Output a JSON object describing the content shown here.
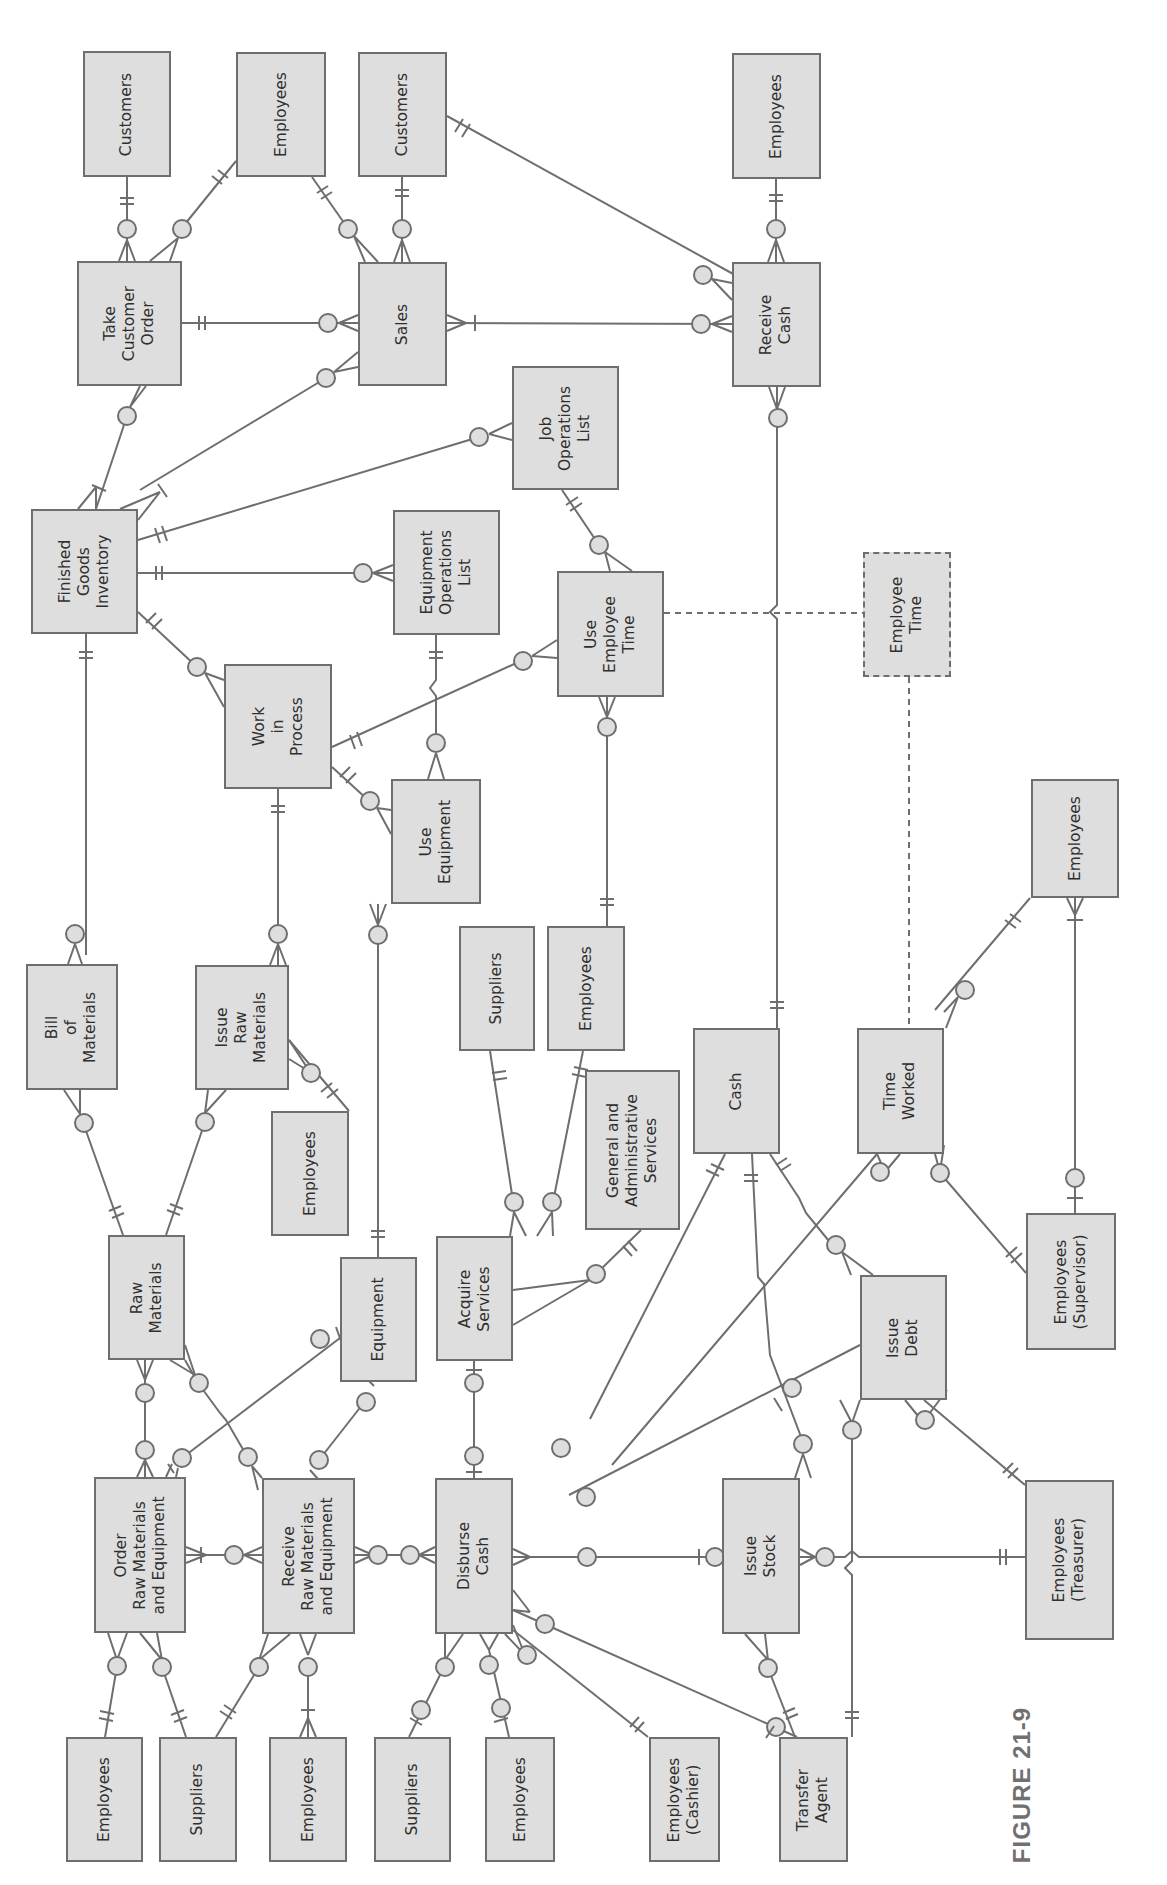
{
  "figure": {
    "label": "FIGURE 21-9"
  },
  "colors": {
    "entity_fill": "#dedede",
    "entity_border": "#6e6e6e",
    "line": "#6e6e6e",
    "text": "#2f2f2f",
    "figure_label": "#707070"
  },
  "orientation": "rotated 90 degrees counter-clockwise (text reads bottom-to-top)",
  "entities": [
    {
      "id": "customers_1",
      "label": "Customers",
      "x": 83,
      "y": 51,
      "w": 88,
      "h": 126
    },
    {
      "id": "employees_1",
      "label": "Employees",
      "x": 236,
      "y": 52,
      "w": 90,
      "h": 125
    },
    {
      "id": "customers_2",
      "label": "Customers",
      "x": 358,
      "y": 52,
      "w": 89,
      "h": 125
    },
    {
      "id": "employees_2",
      "label": "Employees",
      "x": 732,
      "y": 53,
      "w": 89,
      "h": 126
    },
    {
      "id": "take_customer_order",
      "label": "Take\nCustomer\nOrder",
      "x": 77,
      "y": 261,
      "w": 105,
      "h": 125
    },
    {
      "id": "sales",
      "label": "Sales",
      "x": 358,
      "y": 262,
      "w": 89,
      "h": 124
    },
    {
      "id": "receive_cash",
      "label": "Receive\nCash",
      "x": 732,
      "y": 262,
      "w": 89,
      "h": 125
    },
    {
      "id": "job_operations_list",
      "label": "Job\nOperations\nList",
      "x": 512,
      "y": 366,
      "w": 107,
      "h": 124
    },
    {
      "id": "finished_goods_inventory",
      "label": "Finished\nGoods\nInventory",
      "x": 31,
      "y": 509,
      "w": 107,
      "h": 125
    },
    {
      "id": "equipment_operations_list",
      "label": "Equipment\nOperations\nList",
      "x": 393,
      "y": 510,
      "w": 107,
      "h": 125
    },
    {
      "id": "use_employee_time",
      "label": "Use\nEmployee\nTime",
      "x": 557,
      "y": 571,
      "w": 107,
      "h": 126
    },
    {
      "id": "employee_time",
      "label": "Employee\nTime",
      "x": 863,
      "y": 552,
      "w": 88,
      "h": 125,
      "dashed": true
    },
    {
      "id": "work_in_process",
      "label": "Work\nin\nProcess",
      "x": 224,
      "y": 664,
      "w": 108,
      "h": 125
    },
    {
      "id": "use_equipment",
      "label": "Use\nEquipment",
      "x": 391,
      "y": 779,
      "w": 90,
      "h": 125
    },
    {
      "id": "employees_3",
      "label": "Employees",
      "x": 1031,
      "y": 779,
      "w": 88,
      "h": 119
    },
    {
      "id": "bill_of_materials",
      "label": "Bill\nof\nMaterials",
      "x": 26,
      "y": 964,
      "w": 92,
      "h": 126
    },
    {
      "id": "issue_raw_materials",
      "label": "Issue\nRaw\nMaterials",
      "x": 195,
      "y": 965,
      "w": 94,
      "h": 125
    },
    {
      "id": "suppliers_1",
      "label": "Suppliers",
      "x": 459,
      "y": 926,
      "w": 76,
      "h": 125
    },
    {
      "id": "employees_4",
      "label": "Employees",
      "x": 547,
      "y": 926,
      "w": 78,
      "h": 125
    },
    {
      "id": "gen_admin_services",
      "label": "General and\nAdministrative\nServices",
      "x": 585,
      "y": 1070,
      "w": 95,
      "h": 160
    },
    {
      "id": "cash",
      "label": "Cash",
      "x": 693,
      "y": 1028,
      "w": 87,
      "h": 126
    },
    {
      "id": "time_worked",
      "label": "Time\nWorked",
      "x": 857,
      "y": 1028,
      "w": 87,
      "h": 126
    },
    {
      "id": "employees_5",
      "label": "Employees",
      "x": 271,
      "y": 1111,
      "w": 78,
      "h": 125
    },
    {
      "id": "raw_materials",
      "label": "Raw\nMaterials",
      "x": 108,
      "y": 1235,
      "w": 77,
      "h": 125
    },
    {
      "id": "equipment",
      "label": "Equipment",
      "x": 340,
      "y": 1257,
      "w": 77,
      "h": 125
    },
    {
      "id": "acquire_services",
      "label": "Acquire\nServices",
      "x": 436,
      "y": 1236,
      "w": 77,
      "h": 125
    },
    {
      "id": "issue_debt",
      "label": "Issue\nDebt",
      "x": 860,
      "y": 1275,
      "w": 87,
      "h": 125
    },
    {
      "id": "employees_supervisor",
      "label": "Employees\n(Supervisor)",
      "x": 1026,
      "y": 1213,
      "w": 90,
      "h": 137
    },
    {
      "id": "order_rm_equipment",
      "label": "Order\nRaw Materials\nand Equipment",
      "x": 94,
      "y": 1477,
      "w": 92,
      "h": 156
    },
    {
      "id": "receive_rm_equipment",
      "label": "Receive\nRaw Materials\nand Equipment",
      "x": 262,
      "y": 1478,
      "w": 93,
      "h": 156
    },
    {
      "id": "disburse_cash",
      "label": "Disburse\nCash",
      "x": 435,
      "y": 1478,
      "w": 78,
      "h": 156
    },
    {
      "id": "issue_stock",
      "label": "Issue\nStock",
      "x": 722,
      "y": 1478,
      "w": 78,
      "h": 156
    },
    {
      "id": "employees_treasurer",
      "label": "Employees\n(Treasurer)",
      "x": 1025,
      "y": 1480,
      "w": 89,
      "h": 160
    },
    {
      "id": "employees_6",
      "label": "Employees",
      "x": 66,
      "y": 1737,
      "w": 77,
      "h": 125
    },
    {
      "id": "suppliers_2",
      "label": "Suppliers",
      "x": 159,
      "y": 1737,
      "w": 78,
      "h": 125
    },
    {
      "id": "employees_7",
      "label": "Employees",
      "x": 269,
      "y": 1737,
      "w": 78,
      "h": 125
    },
    {
      "id": "suppliers_3",
      "label": "Suppliers",
      "x": 374,
      "y": 1737,
      "w": 77,
      "h": 125
    },
    {
      "id": "employees_8",
      "label": "Employees",
      "x": 545,
      "y": 1737,
      "w": 70,
      "h": 125
    },
    {
      "id": "employees_cashier",
      "label": "Employees\n(Cashier)",
      "x": 649,
      "y": 1737,
      "w": 71,
      "h": 125
    },
    {
      "id": "transfer_agent",
      "label": "Transfer\nAgent",
      "x": 779,
      "y": 1737,
      "w": 69,
      "h": 125
    }
  ],
  "relationships": [
    {
      "from": "customers_1",
      "to": "take_customer_order",
      "from_card": "one-and-only-one",
      "to_card": "zero-or-many"
    },
    {
      "from": "employees_1",
      "to": "take_customer_order",
      "from_card": "one-and-only-one",
      "to_card": "zero-or-many"
    },
    {
      "from": "employees_1",
      "to": "sales",
      "from_card": "one-and-only-one",
      "to_card": "zero-or-many"
    },
    {
      "from": "customers_2",
      "to": "sales",
      "from_card": "one-and-only-one",
      "to_card": "zero-or-many"
    },
    {
      "from": "customers_2",
      "to": "receive_cash",
      "from_card": "one-and-only-one",
      "to_card": "zero-or-many"
    },
    {
      "from": "employees_2",
      "to": "receive_cash",
      "from_card": "one-and-only-one",
      "to_card": "zero-or-many"
    },
    {
      "from": "take_customer_order",
      "to": "sales",
      "from_card": "one-and-only-one",
      "to_card": "zero-or-many"
    },
    {
      "from": "sales",
      "to": "receive_cash",
      "from_card": "one-or-many",
      "to_card": "zero-or-many"
    },
    {
      "from": "finished_goods_inventory",
      "to": "take_customer_order",
      "from_card": "one-or-many",
      "to_card": "zero-or-many"
    },
    {
      "from": "finished_goods_inventory",
      "to": "sales",
      "from_card": "one-or-many",
      "to_card": "zero-or-many"
    },
    {
      "from": "finished_goods_inventory",
      "to": "job_operations_list",
      "from_card": "one-and-only-one",
      "to_card": "zero-or-many"
    },
    {
      "from": "finished_goods_inventory",
      "to": "equipment_operations_list",
      "from_card": "one-and-only-one",
      "to_card": "zero-or-many"
    },
    {
      "from": "finished_goods_inventory",
      "to": "work_in_process",
      "from_card": "one-and-only-one",
      "to_card": "zero-or-many"
    },
    {
      "from": "finished_goods_inventory",
      "to": "bill_of_materials",
      "from_card": "one-and-only-one",
      "to_card": "zero-or-many"
    },
    {
      "from": "job_operations_list",
      "to": "use_employee_time",
      "from_card": "one-and-only-one",
      "to_card": "zero-or-many"
    },
    {
      "from": "equipment_operations_list",
      "to": "use_equipment",
      "from_card": "one-and-only-one",
      "to_card": "zero-or-many"
    },
    {
      "from": "work_in_process",
      "to": "use_employee_time",
      "from_card": "one-and-only-one",
      "to_card": "zero-or-many"
    },
    {
      "from": "work_in_process",
      "to": "use_equipment",
      "from_card": "one-and-only-one",
      "to_card": "zero-or-many"
    },
    {
      "from": "work_in_process",
      "to": "issue_raw_materials",
      "from_card": "one-and-only-one",
      "to_card": "zero-or-many"
    },
    {
      "from": "use_employee_time",
      "to": "employees_4",
      "from_card": "zero-or-many",
      "to_card": "one-and-only-one"
    },
    {
      "from": "use_employee_time",
      "to": "employee_time",
      "style": "dashed"
    },
    {
      "from": "employee_time",
      "to": "time_worked",
      "style": "dashed"
    },
    {
      "from": "use_equipment",
      "to": "equipment",
      "from_card": "zero-or-many",
      "to_card": "one-and-only-one"
    },
    {
      "from": "receive_cash",
      "to": "cash",
      "from_card": "zero-or-many",
      "to_card": "one-and-only-one"
    },
    {
      "from": "bill_of_materials",
      "to": "raw_materials",
      "from_card": "zero-or-many",
      "to_card": "one-and-only-one"
    },
    {
      "from": "issue_raw_materials",
      "to": "raw_materials",
      "from_card": "zero-or-many",
      "to_card": "one-and-only-one"
    },
    {
      "from": "issue_raw_materials",
      "to": "employees_5",
      "from_card": "zero-or-many",
      "to_card": "one-or-many"
    },
    {
      "from": "suppliers_1",
      "to": "acquire_services",
      "from_card": "one-and-only-one",
      "to_card": "zero-or-many"
    },
    {
      "from": "employees_4",
      "to": "acquire_services",
      "from_card": "one-and-only-one",
      "to_card": "zero-or-many"
    },
    {
      "from": "gen_admin_services",
      "to": "acquire_services",
      "from_card": "one-and-only-one",
      "to_card": "zero-or-many"
    },
    {
      "from": "cash",
      "to": "disburse_cash",
      "from_card": "one-and-only-one",
      "to_card": "zero-or-many"
    },
    {
      "from": "cash",
      "to": "issue_stock",
      "from_card": "one-and-only-one",
      "to_card": "zero-or-many"
    },
    {
      "from": "cash",
      "to": "issue_debt",
      "from_card": "one-and-only-one",
      "to_card": "zero-or-many"
    },
    {
      "from": "time_worked",
      "to": "employees_3",
      "from_card": "zero-or-many",
      "to_card": "one-and-only-one"
    },
    {
      "from": "time_worked",
      "to": "employees_supervisor",
      "from_card": "zero-or-many",
      "to_card": "one-and-only-one"
    },
    {
      "from": "time_worked",
      "to": "disburse_cash",
      "from_card": "zero-or-many",
      "to_card": "one-and-only-one"
    },
    {
      "from": "employees_3",
      "to": "employees_supervisor",
      "from_card": "one-or-many",
      "to_card": "zero-or-one"
    },
    {
      "from": "raw_materials",
      "to": "order_rm_equipment",
      "from_card": "one-or-many",
      "to_card": "zero-or-many"
    },
    {
      "from": "raw_materials",
      "to": "receive_rm_equipment",
      "from_card": "one-or-many",
      "to_card": "zero-or-many"
    },
    {
      "from": "equipment",
      "to": "order_rm_equipment",
      "from_card": "one-or-many",
      "to_card": "zero-or-many"
    },
    {
      "from": "equipment",
      "to": "receive_rm_equipment",
      "from_card": "one-or-many",
      "to_card": "zero-or-many"
    },
    {
      "from": "acquire_services",
      "to": "disburse_cash",
      "from_card": "zero-or-one",
      "to_card": "zero-or-one"
    },
    {
      "from": "issue_debt",
      "to": "disburse_cash",
      "from_card": "zero-or-one",
      "to_card": "zero-or-many"
    },
    {
      "from": "issue_debt",
      "to": "transfer_agent",
      "from_card": "zero-or-many",
      "to_card": "one-and-only-one"
    },
    {
      "from": "issue_debt",
      "to": "employees_treasurer",
      "from_card": "zero-or-many",
      "to_card": "one-and-only-one"
    },
    {
      "from": "order_rm_equipment",
      "to": "receive_rm_equipment",
      "from_card": "one-or-many",
      "to_card": "zero-or-many"
    },
    {
      "from": "receive_rm_equipment",
      "to": "disburse_cash",
      "from_card": "zero-or-many",
      "to_card": "zero-or-many"
    },
    {
      "from": "disburse_cash",
      "to": "issue_stock",
      "from_card": "zero-or-many",
      "to_card": "zero-or-one"
    },
    {
      "from": "issue_stock",
      "to": "employees_treasurer",
      "from_card": "zero-or-many",
      "to_card": "one-and-only-one"
    },
    {
      "from": "issue_stock",
      "to": "transfer_agent",
      "from_card": "zero-or-many",
      "to_card": "one-and-only-one"
    },
    {
      "from": "order_rm_equipment",
      "to": "employees_6",
      "from_card": "zero-or-many",
      "to_card": "one-and-only-one"
    },
    {
      "from": "order_rm_equipment",
      "to": "suppliers_2",
      "from_card": "zero-or-many",
      "to_card": "one-and-only-one"
    },
    {
      "from": "receive_rm_equipment",
      "to": "suppliers_2",
      "from_card": "zero-or-many",
      "to_card": "one-and-only-one"
    },
    {
      "from": "receive_rm_equipment",
      "to": "employees_7",
      "from_card": "zero-or-many",
      "to_card": "one-or-many"
    },
    {
      "from": "disburse_cash",
      "to": "suppliers_3",
      "from_card": "zero-or-many",
      "to_card": "zero-or-one"
    },
    {
      "from": "disburse_cash",
      "to": "employees_8",
      "from_card": "zero-or-many",
      "to_card": "zero-or-one"
    },
    {
      "from": "disburse_cash",
      "to": "employees_cashier",
      "from_card": "zero-or-many",
      "to_card": "one-and-only-one"
    },
    {
      "from": "disburse_cash",
      "to": "transfer_agent",
      "from_card": "zero-or-many",
      "to_card": "zero-or-one"
    }
  ]
}
